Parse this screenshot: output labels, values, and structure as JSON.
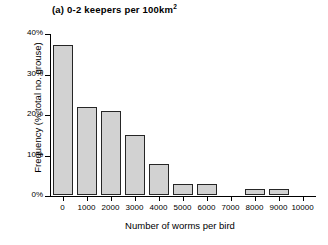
{
  "chart_data": {
    "type": "bar",
    "title": "(a) 0-2 keepers per 100km2",
    "title_prefix": "(a) 0-2 keepers per 100km",
    "title_superscript": "2",
    "xlabel": "Number of worms per bird",
    "ylabel": "Frequency (% total no. grouse)",
    "categories": [
      "0",
      "1000",
      "2000",
      "3000",
      "4000",
      "5000",
      "6000",
      "7000",
      "8000",
      "9000",
      "10000"
    ],
    "values": [
      37.0,
      21.8,
      20.8,
      14.7,
      7.7,
      2.7,
      2.7,
      0,
      1.6,
      1.5,
      null
    ],
    "xtick_labels": [
      "0",
      "1000",
      "2000",
      "3000",
      "4000",
      "5000",
      "6000",
      "7000",
      "8000",
      "9000",
      "10000"
    ],
    "ytick_labels": [
      "0%",
      "10%",
      "20%",
      "30%",
      "40%"
    ],
    "ytick_values": [
      0,
      10,
      20,
      30,
      40
    ],
    "ylim": [
      0,
      40
    ],
    "grid": false,
    "legend": null,
    "bar_fill_color": "#d2d2d2",
    "bar_border_color": "#262626",
    "axis_color": "#000000"
  }
}
